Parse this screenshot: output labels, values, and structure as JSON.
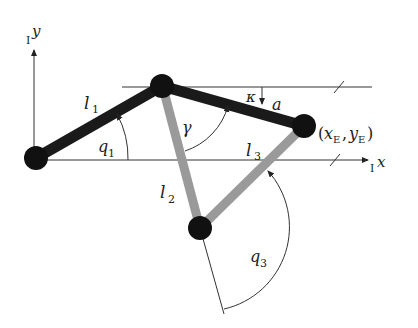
{
  "diagram": {
    "colors": {
      "dark_link": "#1a1a1a",
      "light_link": "#9a9a9a",
      "joint": "#111111",
      "line": "#333333"
    },
    "axes": {
      "y_label": "y",
      "y_prefix": "I",
      "x_label": "x",
      "x_prefix": "I"
    },
    "labels": {
      "l1": "l",
      "l1_sub": "1",
      "l2": "l",
      "l2_sub": "2",
      "l3": "l",
      "l3_sub": "3",
      "q1": "q",
      "q1_sub": "1",
      "q3": "q",
      "q3_sub": "3",
      "gamma": "γ",
      "kappa": "κ",
      "a": "a",
      "end_effector_open": "(",
      "xe": "x",
      "xe_sub": "E",
      "comma": ",",
      "ye": "y",
      "ye_sub": "E",
      "end_effector_close": ")"
    }
  }
}
